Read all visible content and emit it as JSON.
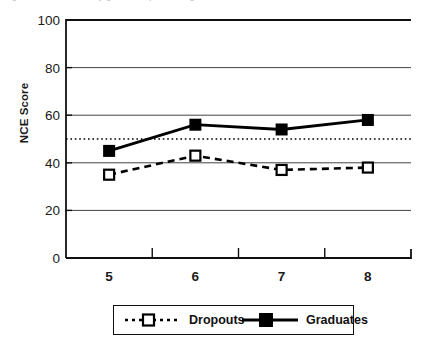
{
  "caption": {
    "text": "Figure 3. NCE Score by grade, dropouts vs. graduates"
  },
  "chart_data": {
    "type": "line",
    "title": "",
    "xlabel": "",
    "ylabel": "NCE Score",
    "x": [
      5,
      6,
      7,
      8
    ],
    "categories": [
      "5",
      "6",
      "7",
      "8"
    ],
    "series": [
      {
        "name": "Dropouts",
        "values": [
          35,
          43,
          37,
          38
        ],
        "marker": "open-square",
        "line_style": "dashed",
        "color": "#000000"
      },
      {
        "name": "Graduates",
        "values": [
          45,
          56,
          54,
          58
        ],
        "marker": "filled-square",
        "line_style": "solid",
        "color": "#000000"
      }
    ],
    "xlim": [
      4.5,
      8.5
    ],
    "ylim": [
      0,
      100
    ],
    "yticks": [
      0,
      20,
      40,
      60,
      80,
      100
    ],
    "ytick_labels": [
      "0",
      "20",
      "40",
      "60",
      "80",
      "100"
    ],
    "xtick_labels": [
      "5",
      "6",
      "7",
      "8"
    ],
    "grid": "horizontal",
    "reference_line": {
      "value": 50,
      "style": "dotted",
      "color": "#000000"
    },
    "legend_position": "bottom",
    "legend_entries": [
      "Dropouts",
      "Graduates"
    ]
  },
  "colors": {
    "axis": "#111111",
    "grid": "#444444",
    "series": "#000000",
    "background": "#ffffff"
  }
}
